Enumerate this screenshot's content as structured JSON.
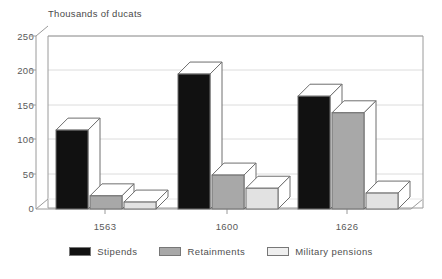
{
  "chart_data": {
    "type": "bar",
    "title": "",
    "subtitle": "",
    "xlabel": "",
    "ylabel": "Thousands of ducats",
    "ylim": [
      0,
      250
    ],
    "yticks": [
      0,
      50,
      100,
      150,
      200,
      250
    ],
    "grid": true,
    "legend_position": "bottom",
    "style": "3d-bars",
    "categories": [
      "1563",
      "1600",
      "1626"
    ],
    "series": [
      {
        "name": "Stipends",
        "color": "#111111",
        "values": [
          114,
          195,
          163
        ]
      },
      {
        "name": "Retainments",
        "color": "#a8a8a8",
        "values": [
          19,
          49,
          139
        ]
      },
      {
        "name": "Military pensions",
        "color": "#e2e2e2",
        "values": [
          10,
          30,
          23
        ]
      }
    ]
  },
  "axis": {
    "y_title": "Thousands of ducats",
    "tick_labels": [
      "250",
      "200",
      "150",
      "100",
      "50",
      "0"
    ],
    "category_labels": [
      "1563",
      "1600",
      "1626"
    ]
  },
  "legend": {
    "items": [
      {
        "label": "Stipends"
      },
      {
        "label": "Retainments"
      },
      {
        "label": "Military pensions"
      }
    ]
  },
  "colors": {
    "series_stipends": "#111111",
    "series_retainments": "#a8a8a8",
    "series_pensions": "#e2e2e2",
    "axis": "#8c8c8c",
    "grid": "#d8d8d8",
    "text": "#4f4f4f"
  }
}
